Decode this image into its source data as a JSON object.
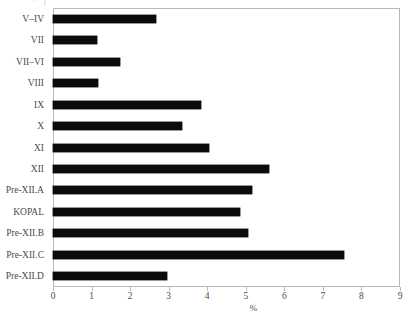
{
  "chart_data": {
    "type": "bar",
    "orientation": "horizontal",
    "title": "",
    "xlabel": "%",
    "ylabel": "",
    "xlim": [
      0,
      9
    ],
    "xticks": [
      0,
      1,
      2,
      3,
      4,
      5,
      6,
      7,
      8,
      9
    ],
    "xticklabels": [
      "0",
      "1",
      "2",
      "3",
      "4",
      "5",
      "6",
      "7",
      "8",
      "9"
    ],
    "grid": false,
    "legend": null,
    "bar_color": "#0b0b0b",
    "frame_color": "#b9b9b9",
    "categories": [
      "V–IV",
      "VII",
      "VII–VI",
      "VIII",
      "IX",
      "X",
      "XI",
      "XII",
      "Pre-XII.A",
      "KOPAL",
      "Pre-XII.B",
      "Pre-XII.C",
      "Pre-XII.D"
    ],
    "values": [
      2.67,
      1.15,
      1.74,
      1.18,
      3.85,
      3.34,
      4.05,
      5.6,
      5.15,
      4.85,
      5.05,
      7.56,
      2.95
    ]
  },
  "artifacts": {
    "top_clipped_text": "∙ │"
  }
}
